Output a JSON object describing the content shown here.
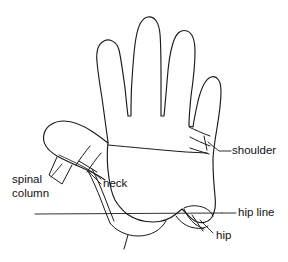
{
  "diagram": {
    "type": "anatomical-analogy-line-drawing",
    "background_color": "#ffffff",
    "stroke_color": "#1a1a1a",
    "text_color": "#111111",
    "labels": {
      "shoulder": "shoulder",
      "spinal_column_line1": "spinal",
      "spinal_column_line2": "column",
      "neck": "neck",
      "hip_line": "hip line",
      "hip": "hip"
    },
    "annotations": [
      {
        "name": "shoulder",
        "text": "shoulder",
        "target": "pinky-finger-base",
        "leader_from": [
          230,
          151
        ],
        "leader_to": [
          212,
          143
        ],
        "text_anchor": [
          232,
          151
        ]
      },
      {
        "name": "neck",
        "text": "neck",
        "target": "thumb-base",
        "leader_from": [
          100,
          182
        ],
        "leader_to": [
          88,
          174
        ],
        "text_anchor": [
          102,
          183
        ]
      },
      {
        "name": "spinal-column",
        "text": "spinal column",
        "target": "thumb-axis",
        "leader_from": [
          52,
          180
        ],
        "leader_to": [
          62,
          166
        ],
        "text_anchor": [
          12,
          180
        ]
      },
      {
        "name": "hip-line",
        "text": "hip line",
        "target": "horizontal-hip-line",
        "leader_from": [
          222,
          213
        ],
        "leader_to": [
          238,
          213
        ],
        "text_anchor": [
          232,
          213
        ]
      },
      {
        "name": "hip",
        "text": "hip",
        "target": "palm-heel-right",
        "leader_from": [
          213,
          231
        ],
        "leader_to": [
          199,
          221
        ],
        "text_anchor": [
          215,
          234
        ]
      }
    ],
    "body_landmark_count": 5
  }
}
